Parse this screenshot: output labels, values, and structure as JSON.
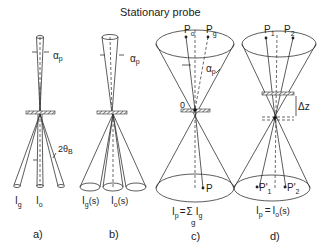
{
  "title": "Stationary probe",
  "panels": [
    {
      "id": "a",
      "caption": "a)",
      "angle_label": "α",
      "angle_sub": "p",
      "bragg_label": "2θ",
      "bragg_sub": "B",
      "beam_labels": [
        {
          "main": "I",
          "sub": "g",
          "suffix": ""
        },
        {
          "main": "I",
          "sub": "o",
          "suffix": ""
        }
      ]
    },
    {
      "id": "b",
      "caption": "b)",
      "angle_label": "α",
      "angle_sub": "p",
      "beam_labels": [
        {
          "main": "I",
          "sub": "g",
          "suffix": "(s)"
        },
        {
          "main": "I",
          "sub": "o",
          "suffix": "(s)"
        }
      ]
    },
    {
      "id": "c",
      "caption": "c)",
      "angle_label": "α",
      "angle_sub": "p",
      "origin_label": "0",
      "top_points": [
        {
          "main": "P",
          "sub": "o"
        },
        {
          "main": "P",
          "sub": "g"
        }
      ],
      "bottom_point": "P",
      "formula": {
        "lhs": "I",
        "lhs_sub": "p",
        "eq": "=",
        "sum": "Σ",
        "sum_sub": "g",
        "rhs": "I",
        "rhs_sub": "g"
      }
    },
    {
      "id": "d",
      "caption": "d)",
      "shift_label": "Δz",
      "top_points": [
        {
          "main": "P",
          "sub": "1"
        },
        {
          "main": "P",
          "sub": "2"
        }
      ],
      "bottom_points": [
        {
          "main": "P'",
          "sub": "1"
        },
        {
          "main": "P'",
          "sub": "2"
        }
      ],
      "formula": {
        "lhs": "I",
        "lhs_sub": "p",
        "eq": "=",
        "rhs": "I",
        "rhs_sub": "o",
        "rhs_suffix": "(s)"
      }
    }
  ]
}
